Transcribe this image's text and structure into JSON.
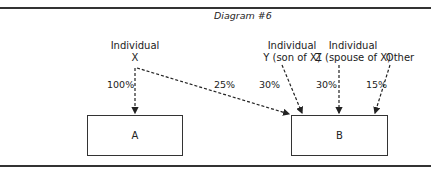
{
  "diagram": {
    "title": "Diagram #6",
    "sources": {
      "x": {
        "line1": "Individual",
        "line2": "X"
      },
      "y": {
        "line1": "Individual",
        "line2": "Y (son of X)"
      },
      "z": {
        "line1": "Individual",
        "line2": "Z (spouse of X)"
      },
      "other": {
        "line1": "Other"
      }
    },
    "targets": {
      "a": "A",
      "b": "B"
    },
    "edges": [
      {
        "from": "X",
        "to": "A",
        "label": "100%"
      },
      {
        "from": "X",
        "to": "B",
        "label": "25%"
      },
      {
        "from": "Y",
        "to": "B",
        "label": "30%"
      },
      {
        "from": "Z",
        "to": "B",
        "label": "30%"
      },
      {
        "from": "Other",
        "to": "B",
        "label": "15%"
      }
    ]
  }
}
